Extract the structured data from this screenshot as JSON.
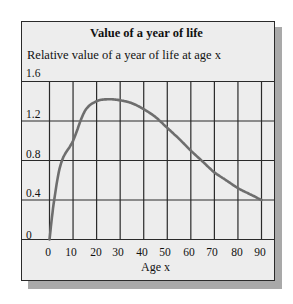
{
  "chart_data": {
    "type": "line",
    "title": "Value of a year of life",
    "subtitle": "Relative value of a year of  life at age x",
    "xlabel": "Age x",
    "ylabel": "Relative value of a year of life at age x",
    "x_ticks": [
      "0",
      "10",
      "20",
      "30",
      "40",
      "50",
      "60",
      "70",
      "80",
      "90"
    ],
    "y_ticks": [
      "0",
      "0.4",
      "0.8",
      "1.2",
      "1.6"
    ],
    "xlim": [
      0,
      90
    ],
    "ylim": [
      0,
      1.6
    ],
    "grid": true,
    "legend": null,
    "series": [
      {
        "name": "Value of a year of life",
        "color": "#6e6e6e",
        "x": [
          0,
          2,
          5,
          10,
          15,
          20,
          25,
          30,
          35,
          40,
          45,
          50,
          55,
          60,
          65,
          70,
          75,
          80,
          85,
          90
        ],
        "values": [
          0,
          0.4,
          0.78,
          1.0,
          1.3,
          1.4,
          1.42,
          1.41,
          1.38,
          1.32,
          1.24,
          1.13,
          1.02,
          0.9,
          0.79,
          0.68,
          0.6,
          0.52,
          0.46,
          0.4
        ]
      }
    ]
  },
  "colors": {
    "panel_bg": "#ededed",
    "grid": "#2a2a2a",
    "curve": "#6e6e6e",
    "shadow": "#a9a9a9"
  }
}
